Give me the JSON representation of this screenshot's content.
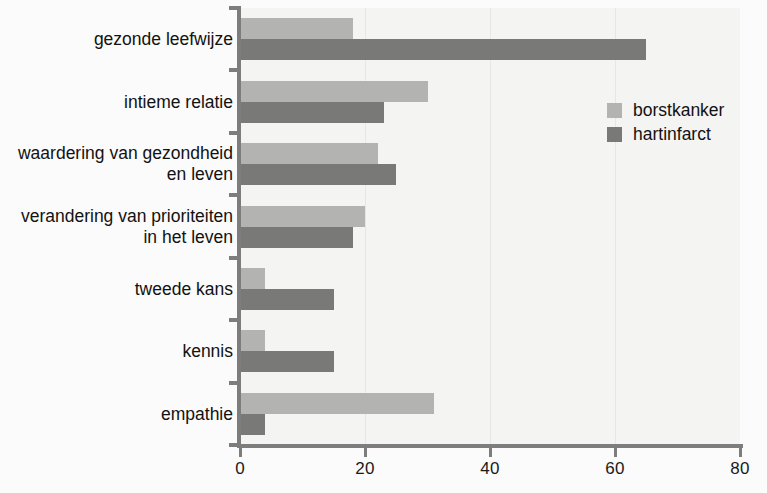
{
  "chart_data": {
    "type": "bar",
    "orientation": "horizontal",
    "title": "",
    "xlabel": "",
    "ylabel": "",
    "xlim": [
      0,
      80
    ],
    "xticks": [
      0,
      20,
      40,
      60,
      80
    ],
    "xtick_labels": [
      "0",
      "20",
      "40",
      "60",
      "80"
    ],
    "grid": false,
    "legend_position": "upper right",
    "categories": [
      "gezonde leefwijze",
      "intieme relatie",
      "waardering van gezondheid\nen leven",
      "verandering van prioriteiten\nin het leven",
      "tweede kans",
      "kennis",
      "empathie"
    ],
    "series": [
      {
        "name": "borstkanker",
        "color": "#b3b3b1",
        "values": [
          18,
          30,
          22,
          20,
          4,
          4,
          31
        ]
      },
      {
        "name": "hartinfarct",
        "color": "#797977",
        "values": [
          65,
          23,
          25,
          18,
          15,
          15,
          4
        ]
      }
    ]
  },
  "legend": {
    "items": [
      {
        "label": "borstkanker",
        "color": "#b3b3b1"
      },
      {
        "label": "hartinfarct",
        "color": "#797977"
      }
    ]
  },
  "colors": {
    "light_gray": "#b3b3b1",
    "dark_gray": "#797977",
    "axis": "#7d7d7d",
    "plot_background": "#f4f4f2",
    "page_background": "#fbfbfb",
    "text": "#121212"
  }
}
